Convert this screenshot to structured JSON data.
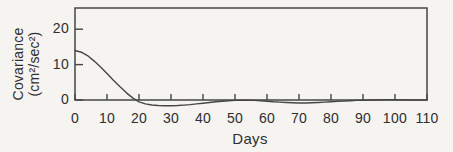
{
  "figure": {
    "ylabel_line1": "Covariance",
    "ylabel_line2": "(cm²/sec²)",
    "xlabel": "Days"
  },
  "chart_data": {
    "type": "line",
    "title": "",
    "xlabel": "Days",
    "ylabel": "Covariance (cm²/sec²)",
    "xlim": [
      0,
      110
    ],
    "ylim": [
      0,
      26
    ],
    "x_ticks": [
      0,
      10,
      20,
      30,
      40,
      50,
      60,
      70,
      80,
      90,
      100,
      110
    ],
    "y_ticks": [
      0,
      10,
      20
    ],
    "grid": false,
    "legend": "none",
    "series": [
      {
        "name": "covariance",
        "x": [
          0,
          2,
          4,
          6,
          8,
          10,
          12,
          14,
          16,
          18,
          20,
          22,
          24,
          26,
          28,
          30,
          32,
          34,
          36,
          38,
          40,
          42,
          44,
          46,
          48,
          50,
          52,
          54,
          56,
          58,
          60,
          62,
          64,
          66,
          68,
          70,
          72,
          74,
          76,
          78,
          80,
          82,
          84,
          86,
          88,
          90,
          92,
          94,
          96,
          98,
          100,
          102,
          104,
          106,
          108,
          110
        ],
        "values": [
          14,
          13.5,
          12.5,
          11,
          9.3,
          7.5,
          5.6,
          3.8,
          2.1,
          0.6,
          -0.5,
          -1.1,
          -1.4,
          -1.55,
          -1.6,
          -1.6,
          -1.55,
          -1.45,
          -1.3,
          -1.1,
          -0.9,
          -0.7,
          -0.5,
          -0.35,
          -0.2,
          -0.1,
          -0.05,
          -0.05,
          -0.1,
          -0.2,
          -0.35,
          -0.5,
          -0.6,
          -0.7,
          -0.8,
          -0.85,
          -0.85,
          -0.8,
          -0.7,
          -0.6,
          -0.5,
          -0.4,
          -0.3,
          -0.2,
          -0.1,
          -0.05,
          0,
          0,
          0.05,
          0.05,
          0.05,
          0.05,
          0,
          0,
          0,
          0
        ]
      }
    ],
    "annotations": [],
    "colors": {
      "line": "#464646",
      "axis": "#464646",
      "text": "#2f2f2f",
      "background": "#f5f4f1"
    }
  }
}
